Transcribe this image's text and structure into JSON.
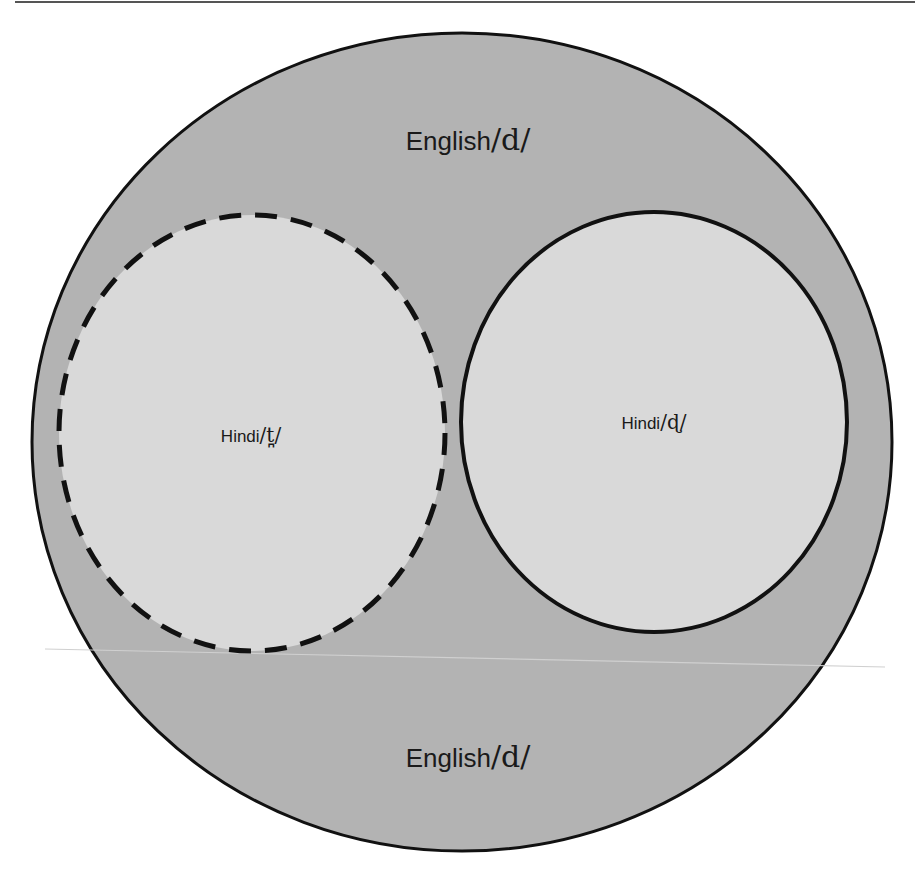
{
  "diagram": {
    "type": "venn-nested",
    "outer": {
      "label_top": "English",
      "label_top_ipa": "/d/",
      "label_bottom": "English",
      "label_bottom_ipa": "/d/",
      "fill": "#b3b3b3",
      "stroke": "#111111",
      "border_style": "solid"
    },
    "inner_left": {
      "label": "Hindi",
      "label_ipa": "/t̪/",
      "fill": "#d9d9d9",
      "stroke": "#111111",
      "border_style": "dashed"
    },
    "inner_right": {
      "label": "Hindi",
      "label_ipa": "/ɖ/",
      "fill": "#d9d9d9",
      "stroke": "#111111",
      "border_style": "solid"
    }
  }
}
